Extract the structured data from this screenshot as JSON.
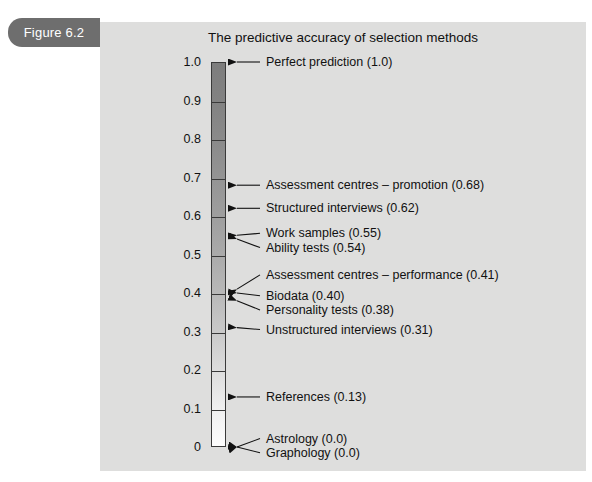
{
  "figure": {
    "tab_label": "Figure 6.2",
    "title": "The predictive accuracy of selection methods"
  },
  "colors": {
    "panel_background": "#dededd",
    "tab_background": "#6e6e6e",
    "tab_text": "#ffffff",
    "bar_top": "#7d7d7d",
    "bar_bottom": "#fdfdfd",
    "bar_outline": "#3a3a3a",
    "text": "#111111"
  },
  "chart_data": {
    "type": "bar",
    "title": "The predictive accuracy of selection methods",
    "xlabel": "",
    "ylabel": "",
    "ylim": [
      0,
      1.0
    ],
    "grid": false,
    "legend": "none",
    "orientation": "vertical-scale",
    "axis_ticks": [
      {
        "value": 1.0,
        "label": "1.0"
      },
      {
        "value": 0.9,
        "label": "0.9"
      },
      {
        "value": 0.8,
        "label": "0.8"
      },
      {
        "value": 0.7,
        "label": "0.7"
      },
      {
        "value": 0.6,
        "label": "0.6"
      },
      {
        "value": 0.5,
        "label": "0.5"
      },
      {
        "value": 0.4,
        "label": "0.4"
      },
      {
        "value": 0.3,
        "label": "0.3"
      },
      {
        "value": 0.2,
        "label": "0.2"
      },
      {
        "value": 0.1,
        "label": "0.1"
      },
      {
        "value": 0.0,
        "label": "0"
      }
    ],
    "categories": [
      "Perfect prediction",
      "Assessment centres – promotion",
      "Structured interviews",
      "Work samples",
      "Ability tests",
      "Assessment centres – performance",
      "Biodata",
      "Personality tests",
      "Unstructured interviews",
      "References",
      "Astrology",
      "Graphology"
    ],
    "values": [
      1.0,
      0.68,
      0.62,
      0.55,
      0.54,
      0.41,
      0.4,
      0.38,
      0.31,
      0.13,
      0.0,
      0.0
    ],
    "annotations": [
      {
        "text": "Perfect prediction (1.0)",
        "value": 1.0,
        "label_y": 1.0
      },
      {
        "text": "Assessment centres – promotion (0.68)",
        "value": 0.68,
        "label_y": 0.68
      },
      {
        "text": "Structured interviews (0.62)",
        "value": 0.62,
        "label_y": 0.62
      },
      {
        "text": "Work samples (0.55)",
        "value": 0.55,
        "label_y": 0.555
      },
      {
        "text": "Ability tests (0.54)",
        "value": 0.54,
        "label_y": 0.518
      },
      {
        "text": "Assessment centres – performance (0.41)",
        "value": 0.41,
        "label_y": 0.447
      },
      {
        "text": "Biodata (0.40)",
        "value": 0.4,
        "label_y": 0.393
      },
      {
        "text": "Personality tests (0.38)",
        "value": 0.38,
        "label_y": 0.356
      },
      {
        "text": "Unstructured interviews (0.31)",
        "value": 0.31,
        "label_y": 0.305
      },
      {
        "text": "References (0.13)",
        "value": 0.13,
        "label_y": 0.13
      },
      {
        "text": "Astrology (0.0)",
        "value": 0.0,
        "label_y": 0.022
      },
      {
        "text": "Graphology (0.0)",
        "value": 0.0,
        "label_y": -0.015
      }
    ]
  }
}
